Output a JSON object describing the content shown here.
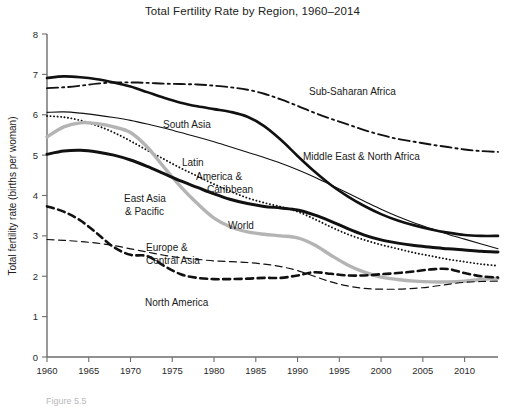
{
  "chart_data": {
    "type": "line",
    "title": "Total Fertility Rate by Region, 1960–2014",
    "xlabel": "",
    "ylabel": "Total fertility rate (births per woman)",
    "xlim": [
      1960,
      2014
    ],
    "ylim": [
      0,
      8
    ],
    "xticks": [
      1960,
      1965,
      1970,
      1975,
      1980,
      1985,
      1990,
      1995,
      2000,
      2005,
      2010
    ],
    "yticks": [
      0,
      1,
      2,
      3,
      4,
      5,
      6,
      7,
      8
    ],
    "grid": false,
    "legend": "inline-annotations",
    "x": [
      1960,
      1962,
      1964,
      1966,
      1968,
      1970,
      1972,
      1974,
      1976,
      1978,
      1980,
      1982,
      1984,
      1986,
      1988,
      1990,
      1992,
      1994,
      1996,
      1998,
      2000,
      2002,
      2004,
      2006,
      2008,
      2010,
      2012,
      2014
    ],
    "series": [
      {
        "name": "Sub-Saharan Africa",
        "style": "dash-dot",
        "color": "#111111",
        "width": 1.9,
        "label_x": 1992,
        "label_y": 6.62,
        "values": [
          6.66,
          6.68,
          6.72,
          6.77,
          6.8,
          6.8,
          6.79,
          6.77,
          6.76,
          6.75,
          6.72,
          6.68,
          6.62,
          6.52,
          6.38,
          6.22,
          6.05,
          5.9,
          5.76,
          5.62,
          5.5,
          5.4,
          5.33,
          5.26,
          5.2,
          5.14,
          5.1,
          5.08
        ]
      },
      {
        "name": "Middle East & North Africa",
        "style": "solid-thick",
        "color": "#111111",
        "width": 2.6,
        "label_x": 1992,
        "label_y": 5.08,
        "values": [
          6.91,
          6.95,
          6.93,
          6.88,
          6.8,
          6.7,
          6.56,
          6.42,
          6.3,
          6.21,
          6.14,
          6.07,
          5.95,
          5.72,
          5.38,
          4.98,
          4.6,
          4.26,
          3.98,
          3.74,
          3.54,
          3.38,
          3.26,
          3.16,
          3.08,
          3.02,
          3.0,
          3.0
        ]
      },
      {
        "name": "South Asia",
        "style": "solid-thin",
        "color": "#111111",
        "width": 1.1,
        "label_x": 1975,
        "label_y": 6.08,
        "values": [
          6.06,
          6.07,
          6.04,
          5.99,
          5.93,
          5.86,
          5.77,
          5.67,
          5.56,
          5.45,
          5.33,
          5.2,
          5.07,
          4.94,
          4.8,
          4.64,
          4.46,
          4.26,
          4.06,
          3.86,
          3.66,
          3.48,
          3.32,
          3.18,
          3.04,
          2.92,
          2.8,
          2.68
        ]
      },
      {
        "name": "Latin America & Caribbean",
        "style": "dotted",
        "color": "#111111",
        "width": 1.9,
        "label_x": 1980,
        "label_y": 4.62,
        "values": [
          5.97,
          5.94,
          5.86,
          5.73,
          5.56,
          5.35,
          5.12,
          4.9,
          4.68,
          4.48,
          4.28,
          4.1,
          3.94,
          3.82,
          3.72,
          3.6,
          3.42,
          3.22,
          3.04,
          2.9,
          2.78,
          2.68,
          2.58,
          2.5,
          2.42,
          2.36,
          2.3,
          2.26
        ]
      },
      {
        "name": "East Asia & Pacific",
        "style": "solid-thick",
        "color": "#b4b4b4",
        "width": 3.4,
        "label_x": 1972,
        "label_y": 4.05,
        "values": [
          5.45,
          5.7,
          5.8,
          5.78,
          5.7,
          5.56,
          5.2,
          4.7,
          4.22,
          3.8,
          3.44,
          3.22,
          3.1,
          3.04,
          3.0,
          2.95,
          2.78,
          2.52,
          2.28,
          2.1,
          1.98,
          1.92,
          1.88,
          1.86,
          1.86,
          1.88,
          1.92,
          1.95
        ]
      },
      {
        "name": "World",
        "style": "solid-thick",
        "color": "#111111",
        "width": 3.0,
        "label_x": 1985,
        "label_y": 3.48,
        "values": [
          5.02,
          5.1,
          5.12,
          5.08,
          5.0,
          4.88,
          4.72,
          4.54,
          4.36,
          4.2,
          4.04,
          3.9,
          3.8,
          3.73,
          3.69,
          3.64,
          3.52,
          3.36,
          3.18,
          3.02,
          2.9,
          2.82,
          2.76,
          2.72,
          2.68,
          2.65,
          2.62,
          2.6
        ]
      },
      {
        "name": "Europe & Central Asia",
        "style": "dashed-thin",
        "color": "#111111",
        "width": 1.2,
        "label_x": 1975,
        "label_y": 3.15,
        "values": [
          2.91,
          2.89,
          2.86,
          2.82,
          2.76,
          2.68,
          2.6,
          2.52,
          2.46,
          2.42,
          2.38,
          2.36,
          2.34,
          2.3,
          2.24,
          2.14,
          2.0,
          1.86,
          1.76,
          1.7,
          1.68,
          1.68,
          1.7,
          1.74,
          1.8,
          1.85,
          1.87,
          1.88
        ]
      },
      {
        "name": "North America",
        "style": "dashed-thick",
        "color": "#111111",
        "width": 2.6,
        "label_x": 1977,
        "label_y": 1.72,
        "values": [
          3.73,
          3.6,
          3.38,
          3.06,
          2.72,
          2.53,
          2.5,
          2.26,
          2.05,
          1.96,
          1.93,
          1.93,
          1.94,
          1.96,
          1.96,
          2.02,
          2.1,
          2.06,
          2.02,
          2.02,
          2.05,
          2.08,
          2.12,
          2.17,
          2.18,
          2.08,
          2.0,
          1.97
        ]
      }
    ],
    "annotations": [
      {
        "name": "sub-saharan-africa-label",
        "text": "Sub-Saharan Africa",
        "x": 309,
        "y": 95,
        "anchor": "start"
      },
      {
        "name": "middle-east-north-africa-label",
        "text": "Middle East & North Africa",
        "x": 303,
        "y": 160,
        "anchor": "start"
      },
      {
        "name": "south-asia-label",
        "text": "South Asia",
        "x": 163,
        "y": 128,
        "anchor": "start"
      },
      {
        "name": "latin-line1-label",
        "text": "Latin",
        "x": 182,
        "y": 166,
        "anchor": "start"
      },
      {
        "name": "latin-line2-label",
        "text": "America &",
        "x": 196,
        "y": 180,
        "anchor": "start"
      },
      {
        "name": "latin-line3-label",
        "text": "Caribbean",
        "x": 207,
        "y": 193,
        "anchor": "start"
      },
      {
        "name": "east-asia-line1-label",
        "text": "East Asia",
        "x": 124,
        "y": 202,
        "anchor": "start"
      },
      {
        "name": "east-asia-line2-label",
        "text": "& Pacific",
        "x": 125,
        "y": 215,
        "anchor": "start"
      },
      {
        "name": "world-label",
        "text": "World",
        "x": 228,
        "y": 229,
        "anchor": "start"
      },
      {
        "name": "europe-line1-label",
        "text": "Europe &",
        "x": 146,
        "y": 251,
        "anchor": "start"
      },
      {
        "name": "europe-line2-label",
        "text": "Central Asia",
        "x": 146,
        "y": 264,
        "anchor": "start"
      },
      {
        "name": "north-america-label",
        "text": "North America",
        "x": 145,
        "y": 306,
        "anchor": "start"
      }
    ]
  },
  "caption": {
    "text": "Figure 5.5"
  }
}
